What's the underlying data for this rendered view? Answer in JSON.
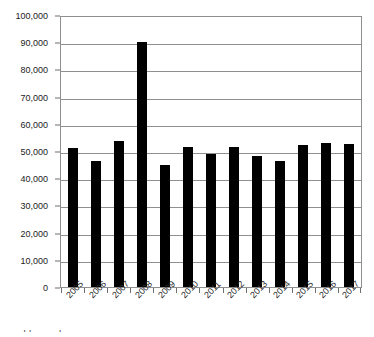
{
  "chart_data": {
    "type": "bar",
    "title": "",
    "xlabel": "",
    "ylabel": "",
    "categories": [
      "2005",
      "2006",
      "2007",
      "2008",
      "2009",
      "2010",
      "2011",
      "2012",
      "2013",
      "2014",
      "2015",
      "2016",
      "2017"
    ],
    "values": [
      51000,
      46500,
      53700,
      90000,
      45000,
      51500,
      49000,
      51300,
      48200,
      46400,
      52300,
      53000,
      52400
    ],
    "ylim": [
      0,
      100000
    ],
    "ytick_values": [
      0,
      10000,
      20000,
      30000,
      40000,
      50000,
      60000,
      70000,
      80000,
      90000,
      100000
    ],
    "ytick_labels": [
      "0",
      "10,000",
      "20,000",
      "30,000",
      "40,000",
      "50,000",
      "60,000",
      "70,000",
      "80,000",
      "90,000",
      "100,000"
    ],
    "grid": true,
    "legend": false,
    "legend_position": "none",
    "bar_color": "#000000",
    "grid_color": "#8f8f8f",
    "xtick_rotation": -45
  },
  "caption": {
    "text": "clipped caption"
  }
}
